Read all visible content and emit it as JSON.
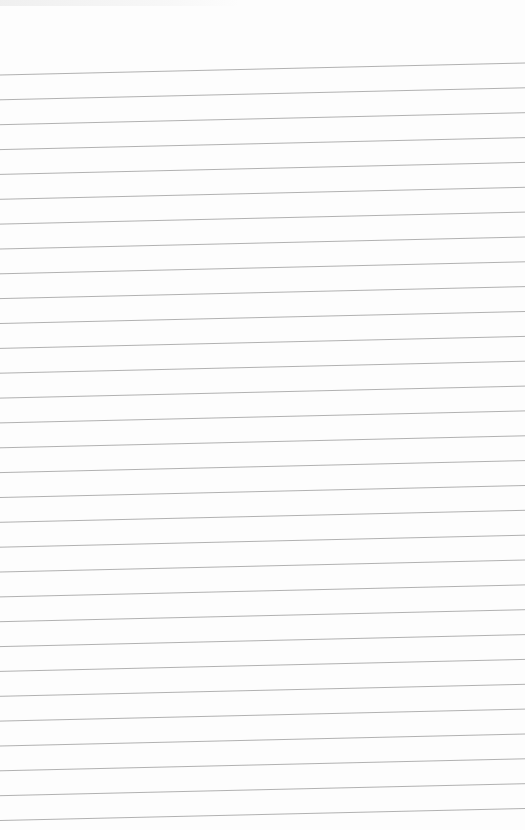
{
  "document": {
    "type": "lined-paper",
    "background_color": "#fdfdfd",
    "rule_color": "#a8a8a8",
    "rule_count": 31,
    "first_rule_left_y": 75,
    "first_rule_right_y": 63,
    "rule_spacing": 24.85,
    "text_content": ""
  }
}
